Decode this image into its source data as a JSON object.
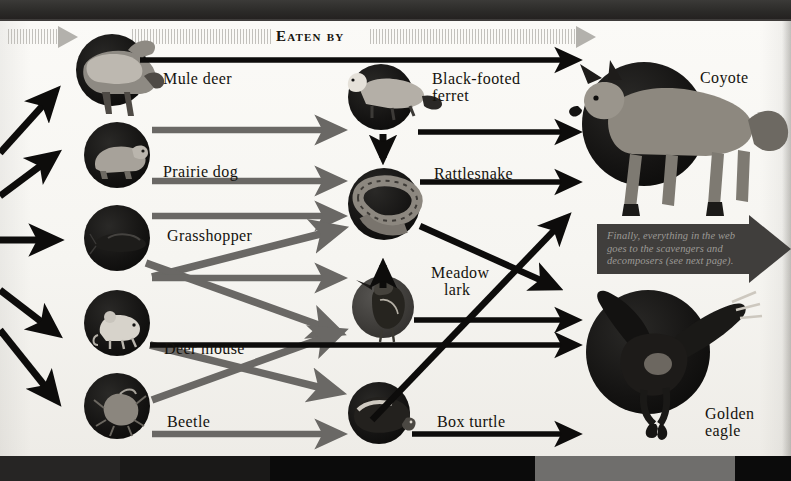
{
  "diagram": {
    "header": {
      "label": "Eaten by",
      "left_arrowhead": "triangle-right",
      "right_arrowhead": "triangle-right"
    },
    "callout": {
      "text": "Finally, everything in the web goes to the scavengers and decomposers (see next page)."
    },
    "columns": [
      {
        "name": "producers-consumers",
        "organisms": [
          {
            "id": "mule-deer",
            "label": "Mule deer"
          },
          {
            "id": "prairie-dog",
            "label": "Prairie dog"
          },
          {
            "id": "grasshopper",
            "label": "Grasshopper"
          },
          {
            "id": "deer-mouse",
            "label": "Deer mouse"
          },
          {
            "id": "beetle",
            "label": "Beetle"
          }
        ]
      },
      {
        "name": "mid-level-predators",
        "organisms": [
          {
            "id": "black-footed-ferret",
            "label": "Black-footed ferret",
            "line1": "Black-footed",
            "line2": "ferret"
          },
          {
            "id": "rattlesnake",
            "label": "Rattlesnake"
          },
          {
            "id": "meadow-lark",
            "label": "Meadow lark",
            "line1": "Meadow",
            "line2": "lark"
          },
          {
            "id": "box-turtle",
            "label": "Box turtle"
          }
        ]
      },
      {
        "name": "top-predators",
        "organisms": [
          {
            "id": "coyote",
            "label": "Coyote"
          },
          {
            "id": "golden-eagle",
            "label": "Golden eagle",
            "line1": "Golden",
            "line2": "eagle"
          }
        ]
      }
    ],
    "colors": {
      "paper": "#f6f5f1",
      "ink": "#14120d",
      "black_arrow": "#0d0c0b",
      "gray_arrow": "#68666300",
      "gray_arrow_solid": "#6a6865",
      "callout_bg": "#403e3c",
      "callout_text": "#9c9a96",
      "band": "#111010"
    }
  }
}
